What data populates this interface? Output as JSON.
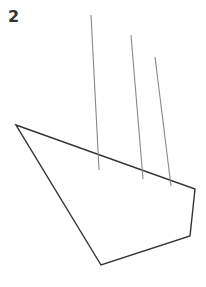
{
  "figure": {
    "label": "2",
    "colors": {
      "outline": "#333333",
      "lines": "#888888",
      "background": "#ffffff"
    },
    "polygon": {
      "points": [
        [
          16,
          125
        ],
        [
          195,
          189
        ],
        [
          190,
          236
        ],
        [
          101,
          265
        ]
      ]
    },
    "vertical_lines": [
      {
        "x1": 91,
        "y1": 15,
        "x2": 99,
        "y2": 170
      },
      {
        "x1": 131,
        "y1": 35,
        "x2": 143,
        "y2": 179
      },
      {
        "x1": 155,
        "y1": 57,
        "x2": 171,
        "y2": 186
      }
    ]
  }
}
